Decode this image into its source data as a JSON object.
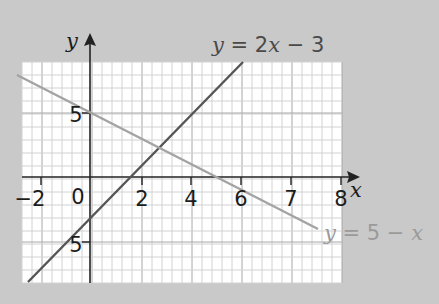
{
  "chart_data": {
    "type": "line",
    "title": "",
    "xlabel": "x",
    "ylabel": "y",
    "x_tick_labels": [
      "−2",
      "0",
      "2",
      "4",
      "6",
      "7",
      "8"
    ],
    "y_tick_labels": [
      "5",
      "−5"
    ],
    "xlim": [
      -2,
      8
    ],
    "ylim": [
      -8,
      9
    ],
    "grid": true,
    "series": [
      {
        "name": "y = 2x − 3",
        "equation": "y = 2x - 3",
        "color": "#555555",
        "x": [
          -2.5,
          6
        ],
        "y": [
          -8,
          9
        ]
      },
      {
        "name": "y = 5 − x",
        "equation": "y = 5 - x",
        "color": "#a0a0a0",
        "x": [
          -2.9,
          7.5
        ],
        "y": [
          7.9,
          -2.5
        ]
      }
    ],
    "annotations": [
      {
        "text": "y = 2x − 3",
        "position": "top, near upper end of line"
      },
      {
        "text": "y = 5 − x",
        "position": "bottom right, near lower end of line"
      }
    ]
  },
  "labels": {
    "x_axis": "x",
    "y_axis": "y",
    "line1_prefix": "y",
    "line1_rest": " = 2",
    "line1_x": "x",
    "line1_end": " − 3",
    "line2_prefix": "y",
    "line2_rest": " = 5 − ",
    "line2_x": "x",
    "ticks_x": [
      "−2",
      "0",
      "2",
      "4",
      "6",
      "7",
      "8"
    ],
    "tick_y_pos": "5",
    "tick_y_neg": "5"
  },
  "colors": {
    "background": "#c9c9c9",
    "grid_paper": "#ffffff",
    "grid_minor": "#d2d2d2",
    "grid_major": "#a8a8a8",
    "axis": "#222222",
    "line1": "#555555",
    "line2": "#a3a3a3"
  }
}
